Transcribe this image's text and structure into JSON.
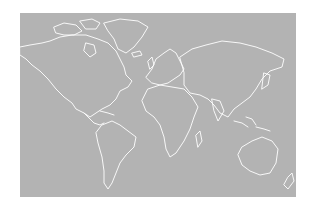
{
  "map": {
    "type": "world-outline",
    "background_color": "#b3b3b3",
    "coastline_color": "#ffffff",
    "page_color": "#ffffff",
    "continents": [
      "North America",
      "Greenland",
      "South America",
      "Europe",
      "Africa",
      "Asia",
      "Australia",
      "New Zealand"
    ]
  }
}
